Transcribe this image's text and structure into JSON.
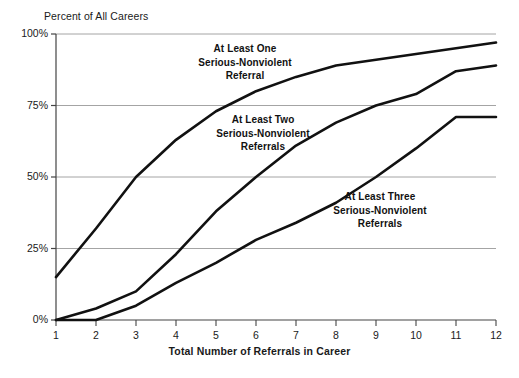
{
  "chart_data": {
    "type": "line",
    "title": "",
    "xlabel": "Total Number of Referrals in Career",
    "ylabel": "Percent of All Careers",
    "x": [
      1,
      2,
      3,
      4,
      5,
      6,
      7,
      8,
      9,
      10,
      11,
      12
    ],
    "xlim": [
      1,
      12
    ],
    "ylim": [
      0,
      100
    ],
    "x_tick_labels": [
      "1",
      "2",
      "3",
      "4",
      "5",
      "6",
      "7",
      "8",
      "9",
      "10",
      "11",
      "12"
    ],
    "y_tick_labels": [
      "0%",
      "25%",
      "50%",
      "75%",
      "100%"
    ],
    "y_ticks": [
      0,
      25,
      50,
      75,
      100
    ],
    "grid": "horizontal",
    "legend": "inline-annotations",
    "line_color": "#111111",
    "grid_color": "#9a9a9a",
    "axis_color": "#555555",
    "background": "#ffffff",
    "series": [
      {
        "name": "At Least One Serious-Nonviolent Referral",
        "annotation": [
          "At Least One",
          "Serious-Nonviolent",
          "Referral"
        ],
        "values": [
          15,
          32,
          50,
          63,
          73,
          80,
          85,
          89,
          91,
          93,
          95,
          97
        ]
      },
      {
        "name": "At Least Two Serious-Nonviolent Referrals",
        "annotation": [
          "At Least Two",
          "Serious-Nonviolent",
          "Referrals"
        ],
        "values": [
          0,
          4,
          10,
          23,
          38,
          50,
          61,
          69,
          75,
          79,
          87,
          89
        ]
      },
      {
        "name": "At Least Three Serious-Nonviolent Referrals",
        "annotation": [
          "At Least Three",
          "Serious-Nonviolent",
          "Referrals"
        ],
        "values": [
          0,
          0,
          5,
          13,
          20,
          28,
          34,
          41,
          50,
          60,
          71,
          71
        ]
      }
    ]
  },
  "labels": {
    "y_axis_title": "Percent of All Careers",
    "x_axis_title": "Total Number of Referrals in Career"
  }
}
